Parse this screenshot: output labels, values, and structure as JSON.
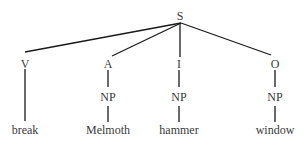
{
  "tree": {
    "root": {
      "label": "S",
      "x": 180,
      "y": 16
    },
    "roles": [
      {
        "label": "V",
        "x": 25,
        "y": 64
      },
      {
        "label": "A",
        "x": 108,
        "y": 64
      },
      {
        "label": "I",
        "x": 179,
        "y": 64
      },
      {
        "label": "O",
        "x": 275,
        "y": 64
      }
    ],
    "np": [
      {
        "label": "NP",
        "x": 108,
        "y": 97
      },
      {
        "label": "NP",
        "x": 179,
        "y": 97
      },
      {
        "label": "NP",
        "x": 275,
        "y": 97
      }
    ],
    "words": [
      {
        "label": "break",
        "x": 25,
        "y": 130
      },
      {
        "label": "Melmoth",
        "x": 108,
        "y": 130
      },
      {
        "label": "hammer",
        "x": 179,
        "y": 130
      },
      {
        "label": "window",
        "x": 275,
        "y": 130
      }
    ],
    "line_color": "#1a1a1a",
    "text_color": "#3a3a3a"
  }
}
